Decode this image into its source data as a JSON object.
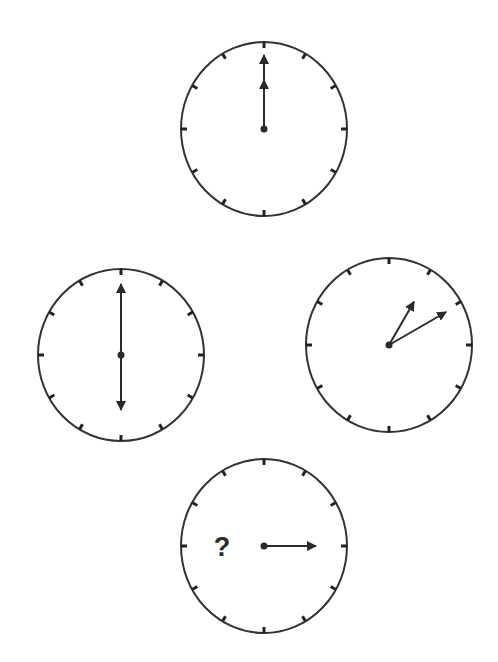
{
  "puzzle": {
    "type": "clock-sequence",
    "colors": {
      "stroke": "#333333",
      "background": "#ffffff",
      "hand": "#2a2a2a"
    },
    "clocks": [
      {
        "id": "top",
        "center": [
          264,
          129
        ],
        "radius": [
          83,
          87
        ],
        "hands": [
          {
            "role": "hand-1",
            "angle_deg": 0,
            "length": 74
          },
          {
            "role": "hand-2",
            "angle_deg": 0,
            "length": 49
          }
        ],
        "reading": "12:00"
      },
      {
        "id": "left",
        "center": [
          121,
          355
        ],
        "radius": [
          83,
          86
        ],
        "hands": [
          {
            "role": "hand-1",
            "angle_deg": 0,
            "length": 71
          },
          {
            "role": "hand-2",
            "angle_deg": 180,
            "length": 55
          }
        ],
        "reading": "6:00 / 12:30"
      },
      {
        "id": "right",
        "center": [
          389,
          345
        ],
        "radius": [
          83,
          87
        ],
        "hands": [
          {
            "role": "hand-1",
            "angle_deg": 30,
            "length": 50
          },
          {
            "role": "hand-2",
            "angle_deg": 60,
            "length": 66
          }
        ],
        "reading": "1:10 / 2:05"
      },
      {
        "id": "bottom",
        "center": [
          264,
          546
        ],
        "radius": [
          83,
          87
        ],
        "hands": [
          {
            "role": "hand-1",
            "angle_deg": 90,
            "length": 52
          }
        ],
        "reading": "?",
        "question_mark": {
          "text": "?",
          "position": [
            222,
            556
          ]
        }
      }
    ],
    "tick_count": 12
  }
}
